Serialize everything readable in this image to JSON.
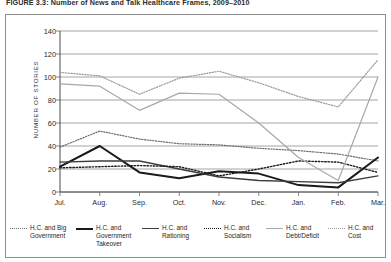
{
  "figure": {
    "title": "FIGURE 3.3: Number of News and Talk Healthcare Frames, 2009–2010"
  },
  "chart_data": {
    "type": "line",
    "title": "FIGURE 3.3: Number of News and Talk Healthcare Frames, 2009–2010",
    "xlabel": "",
    "ylabel": "NUMBER OF STORIES",
    "ylim": [
      0,
      140
    ],
    "yticks": [
      0,
      20,
      40,
      60,
      80,
      100,
      120,
      140
    ],
    "ytick_labels": [
      "0",
      "20",
      "40",
      "60",
      "80",
      "100",
      "120",
      "140"
    ],
    "grid": true,
    "legend_position": "bottom",
    "categories": [
      "Jul.",
      "Aug.",
      "Sep.",
      "Oct.",
      "Nov.",
      "Dec.",
      "Jan.",
      "Feb.",
      "Mar."
    ],
    "series": [
      {
        "name": "H.C. and Big Government",
        "style": "dotted",
        "color": "#6d6d6d",
        "width": 1.2,
        "values": [
          39,
          53,
          46,
          42,
          41,
          38,
          36,
          33,
          27
        ]
      },
      {
        "name": "H.C. and Government Takeover",
        "style": "solid",
        "color": "#1a1a1a",
        "width": 2.0,
        "values": [
          22,
          40,
          17,
          12,
          18,
          16,
          6,
          4,
          30
        ]
      },
      {
        "name": "H.C. and Rationing",
        "style": "solid",
        "color": "#3d3d3d",
        "width": 1.4,
        "values": [
          26,
          27,
          27,
          20,
          13,
          10,
          9,
          8,
          14
        ]
      },
      {
        "name": "H.C. and Socialism",
        "style": "dotted",
        "color": "#1a1a1a",
        "width": 1.4,
        "values": [
          21,
          22,
          23,
          22,
          14,
          20,
          27,
          26,
          17
        ]
      },
      {
        "name": "H.C. and Debt/Deficit",
        "style": "solid",
        "color": "#a8a8a8",
        "width": 1.2,
        "values": [
          94,
          92,
          71,
          86,
          85,
          60,
          30,
          10,
          100
        ]
      },
      {
        "name": "H.C. and Cost",
        "style": "dotted",
        "color": "#9a9a9a",
        "width": 1.2,
        "values": [
          104,
          101,
          85,
          99,
          105,
          95,
          83,
          74,
          115
        ]
      }
    ]
  },
  "legend": {
    "items": [
      {
        "label": "H.C. and Big Government",
        "style": "dotted",
        "color": "#6d6d6d"
      },
      {
        "label": "H.C. and Government Takeover",
        "style": "solid",
        "color": "#1a1a1a"
      },
      {
        "label": "H.C. and Rationing",
        "style": "solid",
        "color": "#3d3d3d"
      },
      {
        "label": "H.C. and Socialism",
        "style": "dotted",
        "color": "#1a1a1a"
      },
      {
        "label": "H.C. and Debt/Deficit",
        "style": "solid",
        "color": "#a8a8a8"
      },
      {
        "label": "H.C. and Cost",
        "style": "dotted",
        "color": "#9a9a9a"
      }
    ]
  }
}
